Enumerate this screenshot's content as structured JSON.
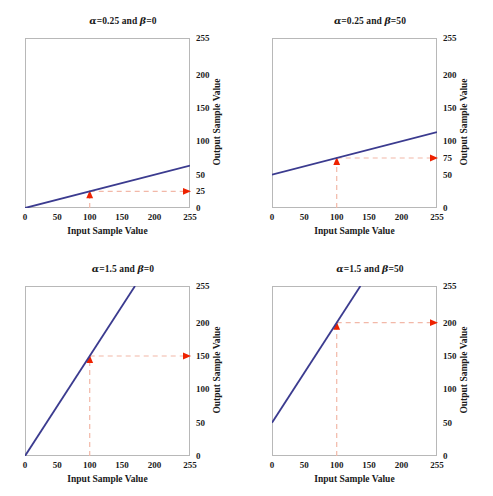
{
  "figure": {
    "width": 493,
    "height": 496,
    "background": "#ffffff",
    "line_color": "#3b3b8f",
    "annotation_line_color": "#f2b8a8",
    "annotation_arrow_color": "#ee2200",
    "axis_color": "#b8b8b8",
    "text_color": "#1a1a1a"
  },
  "chart_data": [
    {
      "id": "panel-top-left",
      "type": "line",
      "title": "α=0.25 and β=0",
      "alpha": 0.25,
      "beta": 0,
      "xlabel": "Input Sample Value",
      "ylabel": "Output Sample Value",
      "xlim": [
        0,
        255
      ],
      "ylim": [
        0,
        255
      ],
      "xticks": [
        0,
        50,
        100,
        150,
        200,
        255
      ],
      "xticklabels": [
        "0",
        "50",
        "100",
        "150",
        "200",
        "255"
      ],
      "yticks": [
        0,
        25,
        50,
        100,
        150,
        200,
        255
      ],
      "yticklabels": [
        "0",
        "25",
        "50",
        "100",
        "150",
        "200",
        "255"
      ],
      "grid": false,
      "legend": null,
      "series": [
        {
          "name": "output = 0.25 * input + 0",
          "x": [
            0,
            255
          ],
          "y": [
            0,
            63.75
          ]
        }
      ],
      "annotation": {
        "input_value": 100,
        "output_value": 25,
        "vertical_arrow": "up",
        "horizontal_arrow": "right"
      }
    },
    {
      "id": "panel-top-right",
      "type": "line",
      "title": "α=0.25 and β=50",
      "alpha": 0.25,
      "beta": 50,
      "xlabel": "Input Sample Value",
      "ylabel": "Output Sample Value",
      "xlim": [
        0,
        255
      ],
      "ylim": [
        0,
        255
      ],
      "xticks": [
        0,
        50,
        100,
        150,
        200,
        255
      ],
      "xticklabels": [
        "0",
        "50",
        "100",
        "150",
        "200",
        "255"
      ],
      "yticks": [
        0,
        50,
        75,
        100,
        150,
        200,
        255
      ],
      "yticklabels": [
        "0",
        "50",
        "75",
        "100",
        "150",
        "200",
        "255"
      ],
      "grid": false,
      "legend": null,
      "series": [
        {
          "name": "output = 0.25 * input + 50",
          "x": [
            0,
            255
          ],
          "y": [
            50,
            113.75
          ]
        }
      ],
      "annotation": {
        "input_value": 100,
        "output_value": 75,
        "vertical_arrow": "up",
        "horizontal_arrow": "right"
      }
    },
    {
      "id": "panel-bottom-left",
      "type": "line",
      "title": "α=1.5 and β=0",
      "alpha": 1.5,
      "beta": 0,
      "xlabel": "Input Sample Value",
      "ylabel": "Output Sample Value",
      "xlim": [
        0,
        255
      ],
      "ylim": [
        0,
        255
      ],
      "xticks": [
        0,
        50,
        100,
        150,
        200,
        255
      ],
      "xticklabels": [
        "0",
        "50",
        "100",
        "150",
        "200",
        "255"
      ],
      "yticks": [
        0,
        50,
        100,
        150,
        200,
        255
      ],
      "yticklabels": [
        "0",
        "50",
        "100",
        "150",
        "200",
        "255"
      ],
      "grid": false,
      "legend": null,
      "series": [
        {
          "name": "output = 1.5 * input + 0",
          "x": [
            0,
            170
          ],
          "y": [
            0,
            255
          ]
        }
      ],
      "annotation": {
        "input_value": 100,
        "output_value": 150,
        "vertical_arrow": "up",
        "horizontal_arrow": "right"
      }
    },
    {
      "id": "panel-bottom-right",
      "type": "line",
      "title": "α=1.5 and β=50",
      "alpha": 1.5,
      "beta": 50,
      "xlabel": "Input Sample Value",
      "ylabel": "Output Sample Value",
      "xlim": [
        0,
        255
      ],
      "ylim": [
        0,
        255
      ],
      "xticks": [
        0,
        50,
        100,
        150,
        200,
        255
      ],
      "xticklabels": [
        "0",
        "50",
        "100",
        "150",
        "200",
        "255"
      ],
      "yticks": [
        0,
        50,
        100,
        150,
        200,
        255
      ],
      "yticklabels": [
        "0",
        "50",
        "100",
        "150",
        "200",
        "255"
      ],
      "grid": false,
      "legend": null,
      "series": [
        {
          "name": "output = 1.5 * input + 50",
          "x": [
            0,
            136.67
          ],
          "y": [
            50,
            255
          ]
        }
      ],
      "annotation": {
        "input_value": 100,
        "output_value": 200,
        "vertical_arrow": "up",
        "horizontal_arrow": "right"
      }
    }
  ]
}
